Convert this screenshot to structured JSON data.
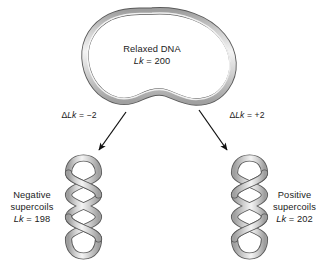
{
  "figure": {
    "background_color": "#ffffff",
    "strand_fill_light": "#f2f2f2",
    "strand_fill_mid": "#c9c9c9",
    "strand_fill_dark": "#9a9a9a",
    "strand_outline_color": "#4a4a4a",
    "arrow_color": "#111111",
    "text_color": "#1b1b1b"
  },
  "relaxed": {
    "name": "relaxed-dna",
    "title": "Relaxed DNA",
    "lk_symbol": "Lk",
    "lk_equation": " = 200",
    "lk_value": "200"
  },
  "transitions": {
    "left": {
      "name": "delta-lk-negative",
      "delta_symbol": "Δ",
      "lk_symbol": "Lk",
      "equation": " = −2",
      "value": "-2"
    },
    "right": {
      "name": "delta-lk-positive",
      "delta_symbol": "Δ",
      "lk_symbol": "Lk",
      "equation": " = +2",
      "value": "+2"
    }
  },
  "outcomes": {
    "negative": {
      "name": "negative-supercoils",
      "line1": "Negative",
      "line2": "supercoils",
      "lk_symbol": "Lk",
      "lk_equation": " = 198",
      "lk_value": "198"
    },
    "positive": {
      "name": "positive-supercoils",
      "line1": "Positive",
      "line2": "supercoils",
      "lk_symbol": "Lk",
      "lk_equation": " = 202",
      "lk_value": "202"
    }
  }
}
